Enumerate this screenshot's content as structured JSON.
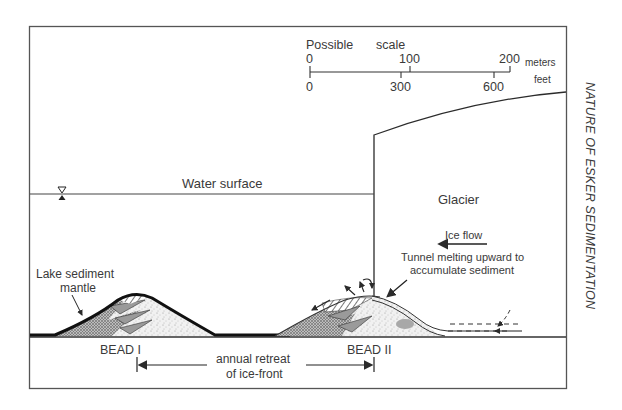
{
  "figure": {
    "side_title": "NATURE OF ESKER SEDIMENTATION",
    "scale": {
      "title_left": "Possible",
      "title_right": "scale",
      "meters_ticks": [
        "0",
        "100",
        "200"
      ],
      "meters_unit": "meters",
      "feet_ticks": [
        "0",
        "300",
        "600"
      ],
      "feet_unit": "feet"
    },
    "labels": {
      "water_surface": "Water surface",
      "glacier": "Glacier",
      "ice_flow": "Ice flow",
      "tunnel_line1": "Tunnel melting upward to",
      "tunnel_line2": "accumulate sediment",
      "lake_sediment_line1": "Lake sediment",
      "lake_sediment_line2": "mantle",
      "bead1": "BEAD I",
      "bead2": "BEAD II",
      "retreat_line1": "annual retreat",
      "retreat_line2": "of ice-front"
    },
    "colors": {
      "line": "#2b2b2b",
      "text": "#3a3a3a",
      "sediment_fill": "#e8e8e8",
      "hatch": "#555555"
    }
  }
}
